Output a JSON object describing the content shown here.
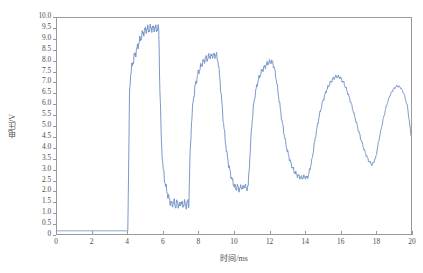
{
  "chart_data": {
    "type": "line",
    "title": "",
    "xlabel": "时间/ms",
    "ylabel": "电压/V",
    "xlim": [
      0,
      20
    ],
    "ylim": [
      0,
      10
    ],
    "grid": false,
    "legend": null,
    "line_color": "#6b8cc4",
    "xticks": [
      "0",
      "2",
      "4",
      "6",
      "8",
      "10",
      "12",
      "14",
      "16",
      "18",
      "20"
    ],
    "xtick_values": [
      0,
      2,
      4,
      6,
      8,
      10,
      12,
      14,
      16,
      18,
      20
    ],
    "yticks": [
      "0",
      "0.5",
      "1.0",
      "1.5",
      "2.0",
      "2.5",
      "3.0",
      "3.5",
      "4.0",
      "4.5",
      "5.0",
      "5.5",
      "6.0",
      "6.5",
      "7.0",
      "7.5",
      "8.0",
      "8.5",
      "9.0",
      "9.5",
      "10.0"
    ],
    "ytick_values": [
      0,
      0.5,
      1.0,
      1.5,
      2.0,
      2.5,
      3.0,
      3.5,
      4.0,
      4.5,
      5.0,
      5.5,
      6.0,
      6.5,
      7.0,
      7.5,
      8.0,
      8.5,
      9.0,
      9.5,
      10.0
    ],
    "series": [
      {
        "name": "电压",
        "description": "Voltage waveform: flat near 0.15 V until t=4 ms, then a sharp rise to a noisy ~9.5 V plateau, followed by damped oscillatory cycles with decreasing peaks (9.5, 8.3, 8.0, 7.3, 6.9) and rising troughs (1.3, 2.1, 2.6, 3.1).",
        "x": [
          0.0,
          0.5,
          1.0,
          1.5,
          2.0,
          2.5,
          3.0,
          3.5,
          3.9,
          3.95,
          4.0,
          4.05,
          4.1,
          4.15,
          4.2,
          4.3,
          4.4,
          4.5,
          4.6,
          4.7,
          4.8,
          4.9,
          5.0,
          5.1,
          5.2,
          5.3,
          5.4,
          5.5,
          5.6,
          5.7,
          5.75,
          5.8,
          5.9,
          6.0,
          6.1,
          6.2,
          6.3,
          6.4,
          6.5,
          6.6,
          6.7,
          6.8,
          6.9,
          7.0,
          7.1,
          7.2,
          7.3,
          7.4,
          7.45,
          7.5,
          7.6,
          7.7,
          7.8,
          7.9,
          8.0,
          8.1,
          8.2,
          8.3,
          8.4,
          8.5,
          8.6,
          8.7,
          8.8,
          8.9,
          9.0,
          9.1,
          9.2,
          9.3,
          9.4,
          9.5,
          9.6,
          9.7,
          9.8,
          9.9,
          10.0,
          10.1,
          10.2,
          10.3,
          10.4,
          10.5,
          10.6,
          10.7,
          10.8,
          10.9,
          11.0,
          11.1,
          11.2,
          11.3,
          11.4,
          11.5,
          11.6,
          11.7,
          11.8,
          11.9,
          12.0,
          12.1,
          12.2,
          12.3,
          12.4,
          12.5,
          12.6,
          12.7,
          12.8,
          12.9,
          13.0,
          13.2,
          13.4,
          13.6,
          13.8,
          14.0,
          14.1,
          14.2,
          14.4,
          14.6,
          14.8,
          15.0,
          15.2,
          15.4,
          15.6,
          15.8,
          16.0,
          16.2,
          16.4,
          16.6,
          16.8,
          17.0,
          17.2,
          17.4,
          17.6,
          17.8,
          18.0,
          18.2,
          18.4,
          18.6,
          18.8,
          19.0,
          19.2,
          19.4,
          19.6,
          19.8,
          20.0
        ],
        "y": [
          0.15,
          0.15,
          0.15,
          0.15,
          0.15,
          0.15,
          0.15,
          0.15,
          0.15,
          0.15,
          0.15,
          3.2,
          6.6,
          7.3,
          7.6,
          8.0,
          8.3,
          8.5,
          8.8,
          9.0,
          9.2,
          9.35,
          9.45,
          9.5,
          9.45,
          9.55,
          9.5,
          9.55,
          9.5,
          9.5,
          9.5,
          7.2,
          4.2,
          3.0,
          2.4,
          2.0,
          1.7,
          1.5,
          1.35,
          1.5,
          1.3,
          1.5,
          1.25,
          1.5,
          1.3,
          1.45,
          1.3,
          1.5,
          1.35,
          3.2,
          5.2,
          6.2,
          6.8,
          7.2,
          7.5,
          7.7,
          7.9,
          8.0,
          8.15,
          8.1,
          8.25,
          8.2,
          8.3,
          8.25,
          8.3,
          8.0,
          7.2,
          6.2,
          5.2,
          4.4,
          3.7,
          3.2,
          2.8,
          2.5,
          2.25,
          2.1,
          2.2,
          2.05,
          2.2,
          2.1,
          2.25,
          2.1,
          2.2,
          3.6,
          5.0,
          5.9,
          6.5,
          6.9,
          7.2,
          7.4,
          7.6,
          7.7,
          7.8,
          7.9,
          7.95,
          8.0,
          7.9,
          7.6,
          7.1,
          6.5,
          5.9,
          5.3,
          4.8,
          4.3,
          3.9,
          3.3,
          2.9,
          2.7,
          2.6,
          2.65,
          2.6,
          2.7,
          3.4,
          4.5,
          5.4,
          6.1,
          6.6,
          6.95,
          7.2,
          7.3,
          7.25,
          7.0,
          6.6,
          6.1,
          5.5,
          4.9,
          4.3,
          3.8,
          3.4,
          3.2,
          3.5,
          4.4,
          5.2,
          5.9,
          6.4,
          6.7,
          6.85,
          6.8,
          6.5,
          5.9,
          4.6
        ]
      }
    ]
  },
  "axes": {
    "x_title": "时间/ms",
    "y_title": "电压/V"
  }
}
